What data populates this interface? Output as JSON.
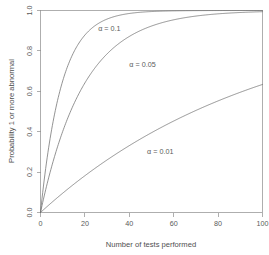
{
  "chart_data": {
    "type": "line",
    "title": "",
    "xlabel": "Number of tests performed",
    "ylabel": "Probability 1 or more abnormal",
    "xlim": [
      0,
      100
    ],
    "ylim": [
      0,
      1
    ],
    "grid": false,
    "legend_position": "inline-curve-labels",
    "formula": "1 - (1 - alpha)^n",
    "x_ticks": [
      0,
      20,
      40,
      60,
      80,
      100
    ],
    "x_tick_labels": [
      "0",
      "20",
      "40",
      "60",
      "80",
      "100"
    ],
    "y_ticks": [
      0,
      0.2,
      0.4,
      0.6,
      0.8,
      1
    ],
    "y_tick_labels": [
      "0.0",
      "0.2",
      "0.4",
      "0.6",
      "0.8",
      "1.0"
    ],
    "x": [
      0,
      5,
      10,
      15,
      20,
      25,
      30,
      35,
      40,
      45,
      50,
      55,
      60,
      65,
      70,
      75,
      80,
      85,
      90,
      95,
      100
    ],
    "series": [
      {
        "name": "alpha = 0.1",
        "label": "α = 0.1",
        "alpha": 0.1,
        "label_x": 26,
        "label_y": 0.9,
        "values": [
          0,
          0.41,
          0.651,
          0.794,
          0.878,
          0.928,
          0.958,
          0.975,
          0.985,
          0.991,
          0.995,
          0.997,
          0.998,
          0.999,
          0.999,
          1,
          1,
          1,
          1,
          1,
          1
        ]
      },
      {
        "name": "alpha = 0.05",
        "label": "α = 0.05",
        "alpha": 0.05,
        "label_x": 40,
        "label_y": 0.72,
        "values": [
          0,
          0.226,
          0.401,
          0.537,
          0.642,
          0.723,
          0.785,
          0.834,
          0.871,
          0.901,
          0.923,
          0.94,
          0.954,
          0.964,
          0.972,
          0.979,
          0.983,
          0.987,
          0.99,
          0.992,
          0.994
        ]
      },
      {
        "name": "alpha = 0.01",
        "label": "α = 0.01",
        "alpha": 0.01,
        "label_x": 48,
        "label_y": 0.29,
        "values": [
          0,
          0.049,
          0.096,
          0.14,
          0.182,
          0.222,
          0.26,
          0.297,
          0.331,
          0.364,
          0.395,
          0.425,
          0.453,
          0.48,
          0.505,
          0.53,
          0.553,
          0.575,
          0.596,
          0.615,
          0.634
        ]
      }
    ]
  },
  "axes": {
    "x_title": "Number of tests performed",
    "y_title": "Probability 1 or more abnormal"
  },
  "colors": {
    "curve": "#6f6f6f",
    "axis": "#8d8d8d",
    "border": "#9a9a9a",
    "text": "#5a5a5a",
    "background": "#ffffff"
  }
}
